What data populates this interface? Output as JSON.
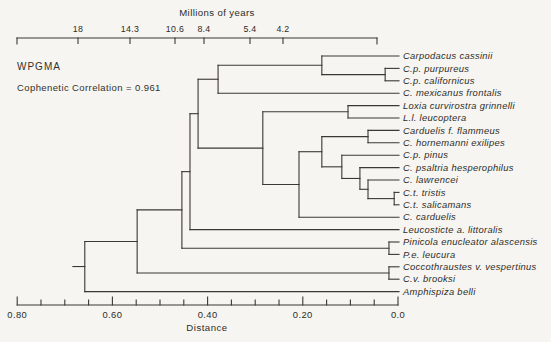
{
  "figure": {
    "method": "WPGMA",
    "cophenetic": "Cophenetic Correlation = 0.961"
  },
  "top_axis": {
    "title": "Millions of years",
    "title_x": 217,
    "y": 38,
    "x1": 17,
    "x2": 377,
    "ticks": [
      {
        "label": "18",
        "x": 78
      },
      {
        "label": "14.3",
        "x": 130
      },
      {
        "label": "10.6",
        "x": 175
      },
      {
        "label": "8.4",
        "x": 204
      },
      {
        "label": "5.4",
        "x": 250
      },
      {
        "label": "4.2",
        "x": 283
      }
    ]
  },
  "bottom_axis": {
    "label": "Distance",
    "label_x": 207,
    "y": 305,
    "major_ticks": [
      {
        "label": "0.80",
        "d": 0.8
      },
      {
        "label": "0.60",
        "d": 0.6
      },
      {
        "label": "0.40",
        "d": 0.4
      },
      {
        "label": "0.20",
        "d": 0.2
      },
      {
        "label": "0.0",
        "d": 0.0
      }
    ],
    "minor_step": 0.05,
    "range": [
      0.8,
      0.0
    ]
  },
  "chart_data": {
    "type": "dendrogram",
    "orientation": "leaves-right",
    "distance_scale": {
      "x_at_zero": 398,
      "px_per_unit": 476
    },
    "leaf_y_start": 56,
    "leaf_y_step": 12.4,
    "leaf_line_end_x": 399,
    "label_x": 403,
    "root_stub_distance": 0.683,
    "leaves": [
      {
        "id": "L1",
        "name": "Carpodacus cassinii"
      },
      {
        "id": "L2",
        "name": "C.p. purpureus"
      },
      {
        "id": "L3",
        "name": "C.p. californicus"
      },
      {
        "id": "L4",
        "name": "C. mexicanus frontalis"
      },
      {
        "id": "L5",
        "name": "Loxia curvirostra grinnelli"
      },
      {
        "id": "L6",
        "name": "L.l. leucoptera"
      },
      {
        "id": "L7",
        "name": "Carduelis f. flammeus"
      },
      {
        "id": "L8",
        "name": "C. hornemanni exilipes"
      },
      {
        "id": "L9",
        "name": "C.p. pinus"
      },
      {
        "id": "L10",
        "name": "C. psaltria hesperophilus"
      },
      {
        "id": "L11",
        "name": "C. lawrencei"
      },
      {
        "id": "L12",
        "name": "C.t. tristis"
      },
      {
        "id": "L13",
        "name": "C.t. salicamans"
      },
      {
        "id": "L14",
        "name": "C. carduelis"
      },
      {
        "id": "L15",
        "name": "Leucosticte a. littoralis"
      },
      {
        "id": "L16",
        "name": "Pinicola enucleator alascensis"
      },
      {
        "id": "L17",
        "name": "P.e. leucura"
      },
      {
        "id": "L18",
        "name": "Coccothraustes v. vespertinus"
      },
      {
        "id": "L19",
        "name": "C.v. brooksi"
      },
      {
        "id": "L20",
        "name": "Amphispiza belli"
      }
    ],
    "nodes": [
      {
        "id": "n_purp",
        "children": [
          "L2",
          "L3"
        ],
        "distance": 0.027
      },
      {
        "id": "n_carp",
        "children": [
          "L1",
          "n_purp"
        ],
        "distance": 0.16
      },
      {
        "id": "n_carpm",
        "children": [
          "n_carp",
          "L4"
        ],
        "distance": 0.378
      },
      {
        "id": "n_loxia",
        "children": [
          "L5",
          "L6"
        ],
        "distance": 0.105
      },
      {
        "id": "n_redp",
        "children": [
          "L7",
          "L8"
        ],
        "distance": 0.063
      },
      {
        "id": "n_trist",
        "children": [
          "L12",
          "L13"
        ],
        "distance": 0.008
      },
      {
        "id": "n_lawr",
        "children": [
          "L11",
          "n_trist"
        ],
        "distance": 0.063
      },
      {
        "id": "n_psal",
        "children": [
          "L10",
          "n_lawr"
        ],
        "distance": 0.08
      },
      {
        "id": "n_pinus",
        "children": [
          "L9",
          "n_psal"
        ],
        "distance": 0.118
      },
      {
        "id": "n_card",
        "children": [
          "n_redp",
          "n_pinus"
        ],
        "distance": 0.16
      },
      {
        "id": "n_card2",
        "children": [
          "n_card",
          "L14"
        ],
        "distance": 0.208
      },
      {
        "id": "n_mid",
        "children": [
          "n_loxia",
          "n_card2"
        ],
        "distance": 0.284
      },
      {
        "id": "n_upper",
        "children": [
          "n_carpm",
          "n_mid"
        ],
        "distance": 0.42
      },
      {
        "id": "n_leuco",
        "children": [
          "n_upper",
          "L15"
        ],
        "distance": 0.437
      },
      {
        "id": "n_pinic",
        "children": [
          "L16",
          "L17"
        ],
        "distance": 0.019
      },
      {
        "id": "n_p2",
        "children": [
          "n_leuco",
          "n_pinic"
        ],
        "distance": 0.454
      },
      {
        "id": "n_cocc",
        "children": [
          "L18",
          "L19"
        ],
        "distance": 0.019
      },
      {
        "id": "n_q",
        "children": [
          "n_p2",
          "n_cocc"
        ],
        "distance": 0.548
      },
      {
        "id": "root",
        "children": [
          "n_q",
          "L20"
        ],
        "distance": 0.658
      }
    ]
  }
}
